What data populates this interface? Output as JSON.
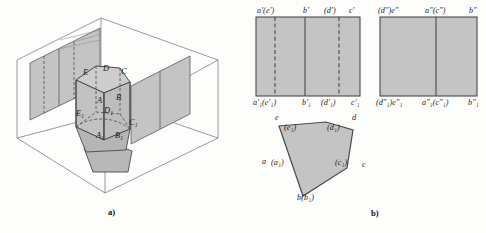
{
  "figure": {
    "title_a": "a)",
    "title_b": "b)",
    "colors": {
      "fill_gray": "#bfbfbf",
      "fill_gray_light": "#c9c9c9",
      "fill_solid": "#b5b5b5",
      "stroke_dark": "#4a4a4a",
      "stroke_thin": "#6e6e6e",
      "hidden_dash": "#555555",
      "text": "#1a1a1a",
      "background": "#fdfdfc"
    }
  },
  "pictorial": {
    "name": "pentagonal-prism-in-projection-box",
    "vertex_labels": [
      {
        "id": "E",
        "text": "E",
        "sub": "",
        "x": 83,
        "y": 74
      },
      {
        "id": "D",
        "text": "D",
        "sub": "",
        "x": 105,
        "y": 71
      },
      {
        "id": "C",
        "text": "C",
        "sub": "",
        "x": 122,
        "y": 73
      },
      {
        "id": "A",
        "text": "A",
        "sub": "",
        "x": 98,
        "y": 102
      },
      {
        "id": "B",
        "text": "B",
        "sub": "",
        "x": 117,
        "y": 99
      },
      {
        "id": "D1",
        "text": "D",
        "sub": "1",
        "x": 106,
        "y": 113
      },
      {
        "id": "E1",
        "text": "E",
        "sub": "1",
        "x": 79,
        "y": 116
      },
      {
        "id": "C1",
        "text": "C",
        "sub": "1",
        "x": 130,
        "y": 125
      },
      {
        "id": "A1",
        "text": "A",
        "sub": "1",
        "x": 98,
        "y": 138
      },
      {
        "id": "B1",
        "text": "B",
        "sub": "1",
        "x": 117,
        "y": 138
      }
    ]
  },
  "front_view": {
    "name": "front-view-rectangle",
    "top_labels": [
      {
        "id": "ae-prime",
        "text": "a′(e′)",
        "x": 257,
        "y": 8
      },
      {
        "id": "b-prime",
        "text": "b′",
        "x": 305,
        "y": 8
      },
      {
        "id": "d-prime",
        "text": "(d′)",
        "x": 325,
        "y": 8
      },
      {
        "id": "c-prime",
        "text": "c′",
        "x": 351,
        "y": 8
      }
    ],
    "bottom_labels": [
      {
        "id": "a1e1-prime",
        "text": "a",
        "sub": "1",
        "suffix": "′ (e′",
        "sub2": "1",
        "tail": ")",
        "full": "a′₁(e′₁)",
        "x": 254,
        "y": 101
      },
      {
        "id": "b1-prime",
        "full": "b′₁",
        "x": 303,
        "y": 101
      },
      {
        "id": "d1-prime",
        "full": "(d′₁)",
        "x": 322,
        "y": 101
      },
      {
        "id": "c1-prime",
        "full": "c′₁",
        "x": 352,
        "y": 101
      }
    ]
  },
  "side_view": {
    "name": "side-view-rectangle",
    "top_labels": [
      {
        "id": "de-dprime",
        "text": "(d″)e″",
        "x": 379,
        "y": 8
      },
      {
        "id": "ac-dprime",
        "text": "a″(c″)",
        "x": 427,
        "y": 8
      },
      {
        "id": "b-dprime",
        "text": "b″",
        "x": 470,
        "y": 8
      }
    ],
    "bottom_labels": [
      {
        "id": "d1e1-dprime",
        "full": "(d″₁)e″₁",
        "x": 377,
        "y": 101
      },
      {
        "id": "a1c1-dprime",
        "full": "a″₁(c″₁)",
        "x": 424,
        "y": 101
      },
      {
        "id": "b1-dprime",
        "full": "b″₁",
        "x": 470,
        "y": 101
      }
    ]
  },
  "top_view": {
    "name": "top-view-pentagon",
    "labels": [
      {
        "id": "e",
        "full": "e",
        "x": 276,
        "y": 118
      },
      {
        "id": "e1",
        "full": "(e₁)",
        "x": 285,
        "y": 128
      },
      {
        "id": "d1",
        "full": "(d₁)",
        "x": 329,
        "y": 128
      },
      {
        "id": "d",
        "full": "d",
        "x": 352,
        "y": 118
      },
      {
        "id": "a",
        "full": "a",
        "x": 264,
        "y": 163
      },
      {
        "id": "a1",
        "full": "(a₁)",
        "x": 272,
        "y": 164
      },
      {
        "id": "c1",
        "full": "(c₁)",
        "x": 336,
        "y": 164
      },
      {
        "id": "c",
        "full": "c",
        "x": 362,
        "y": 166
      },
      {
        "id": "b_b1",
        "full": "b(b₁)",
        "x": 299,
        "y": 198
      }
    ]
  }
}
